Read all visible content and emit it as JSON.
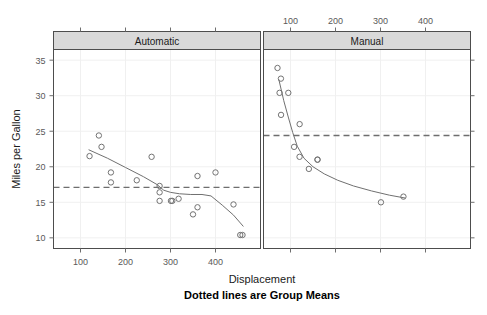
{
  "figure": {
    "xlabel": "Displacement",
    "ylabel": "Miles per Gallon",
    "subtitle": "Dotted lines are Group Means",
    "strip_left": "Automatic",
    "strip_right": "Manual"
  },
  "colors": {
    "point_stroke": "#737373",
    "smooth_line": "#707070",
    "mean_line": "#6e6e6e",
    "strip_bg": "#d9d9d9",
    "strip_border": "#4d4d4d",
    "panel_border": "#4d4d4d",
    "grid": "#f0f0f0",
    "tick": "#6e6e6e",
    "text": "#3a3a3a"
  },
  "chart_data": {
    "type": "scatter",
    "title": "",
    "subtitle": "Dotted lines are Group Means",
    "xlabel": "Displacement",
    "ylabel": "Miles per Gallon",
    "grid": true,
    "legend": "none",
    "xlim": [
      40,
      500
    ],
    "ylim": [
      8.5,
      36.5
    ],
    "xticks": [
      100,
      200,
      300,
      400
    ],
    "yticks": [
      10,
      15,
      20,
      25,
      30,
      35
    ],
    "panels": [
      {
        "name": "Automatic",
        "strip_label": "Automatic",
        "axis_side": "bottom",
        "axis_ticks": [
          100,
          200,
          300,
          400
        ],
        "mean_line": 17.1,
        "points": [
          {
            "x": 120.1,
            "y": 21.5
          },
          {
            "x": 140.8,
            "y": 24.4
          },
          {
            "x": 146.7,
            "y": 22.8
          },
          {
            "x": 167.6,
            "y": 19.2
          },
          {
            "x": 167.6,
            "y": 17.8
          },
          {
            "x": 225.0,
            "y": 18.1
          },
          {
            "x": 258.0,
            "y": 21.4
          },
          {
            "x": 275.8,
            "y": 17.3
          },
          {
            "x": 275.8,
            "y": 16.4
          },
          {
            "x": 275.8,
            "y": 15.2
          },
          {
            "x": 301.0,
            "y": 15.2
          },
          {
            "x": 304.0,
            "y": 15.2
          },
          {
            "x": 318.0,
            "y": 15.5
          },
          {
            "x": 350.0,
            "y": 13.3
          },
          {
            "x": 360.0,
            "y": 14.3
          },
          {
            "x": 360.0,
            "y": 18.7
          },
          {
            "x": 400.0,
            "y": 19.2
          },
          {
            "x": 440.0,
            "y": 14.7
          },
          {
            "x": 455.0,
            "y": 10.4
          },
          {
            "x": 460.0,
            "y": 10.4
          }
        ],
        "smooth": [
          {
            "x": 118,
            "y": 22.4
          },
          {
            "x": 160,
            "y": 21.2
          },
          {
            "x": 200,
            "y": 19.9
          },
          {
            "x": 240,
            "y": 18.6
          },
          {
            "x": 270,
            "y": 17.5
          },
          {
            "x": 285,
            "y": 16.7
          },
          {
            "x": 300,
            "y": 16.4
          },
          {
            "x": 320,
            "y": 16.2
          },
          {
            "x": 345,
            "y": 16.1
          },
          {
            "x": 370,
            "y": 16.1
          },
          {
            "x": 390,
            "y": 15.9
          },
          {
            "x": 415,
            "y": 14.6
          },
          {
            "x": 440,
            "y": 13.2
          },
          {
            "x": 462,
            "y": 11.6
          }
        ]
      },
      {
        "name": "Manual",
        "strip_label": "Manual",
        "axis_side": "top",
        "axis_ticks": [
          100,
          200,
          300,
          400
        ],
        "mean_line": 24.4,
        "points": [
          {
            "x": 71.1,
            "y": 33.9
          },
          {
            "x": 78.7,
            "y": 32.4
          },
          {
            "x": 75.7,
            "y": 30.4
          },
          {
            "x": 95.1,
            "y": 30.4
          },
          {
            "x": 79.0,
            "y": 27.3
          },
          {
            "x": 120.3,
            "y": 26.0
          },
          {
            "x": 108.0,
            "y": 22.8
          },
          {
            "x": 120.1,
            "y": 21.4
          },
          {
            "x": 140.8,
            "y": 19.7
          },
          {
            "x": 160.0,
            "y": 21.0
          },
          {
            "x": 160.0,
            "y": 21.0
          },
          {
            "x": 301.0,
            "y": 15.0
          },
          {
            "x": 351.0,
            "y": 15.8
          }
        ],
        "smooth": [
          {
            "x": 74,
            "y": 32.3
          },
          {
            "x": 85,
            "y": 29.3
          },
          {
            "x": 95,
            "y": 27.0
          },
          {
            "x": 105,
            "y": 24.8
          },
          {
            "x": 115,
            "y": 22.9
          },
          {
            "x": 130,
            "y": 21.2
          },
          {
            "x": 150,
            "y": 20.0
          },
          {
            "x": 175,
            "y": 19.0
          },
          {
            "x": 205,
            "y": 18.1
          },
          {
            "x": 240,
            "y": 17.3
          },
          {
            "x": 280,
            "y": 16.6
          },
          {
            "x": 320,
            "y": 16.0
          },
          {
            "x": 355,
            "y": 15.6
          }
        ]
      }
    ]
  }
}
